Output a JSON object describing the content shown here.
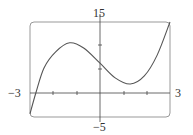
{
  "chart_data": {
    "type": "line",
    "title": "",
    "xlabel": "",
    "ylabel": "",
    "xlim": [
      -3,
      3
    ],
    "ylim": [
      -5,
      15
    ],
    "grid": false,
    "tick_labels": {
      "x_min": "−3",
      "x_max": "3",
      "y_max": "15",
      "y_min": "−5"
    },
    "x": [
      -3,
      -2.75,
      -2.4,
      -1.9,
      -1.3,
      -0.7,
      0,
      0.65,
      1.3,
      1.9,
      2.45,
      3
    ],
    "y": [
      -4.4,
      0,
      5.3,
      8.7,
      10.6,
      9.5,
      6.3,
      3.2,
      1.9,
      3.6,
      8.0,
      15
    ],
    "series": [
      {
        "name": "f(x)",
        "color": "#555555"
      }
    ]
  }
}
